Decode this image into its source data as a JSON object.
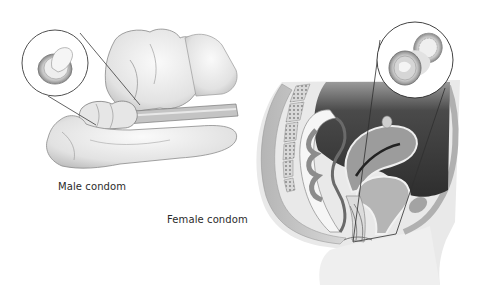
{
  "figure": {
    "panels": [
      {
        "id": "male",
        "caption": "Male condom",
        "inset": "rolled condom detail"
      },
      {
        "id": "female",
        "caption": "Female condom",
        "inset": "female condom ring detail"
      }
    ]
  },
  "colors": {
    "background": "#ffffff",
    "skin_light": "#f0f0f0",
    "skin_mid": "#d2d2d2",
    "tissue_gray": "#a9a9a9",
    "cavity_dark": "#3a3a3a",
    "outline": "#3c3c3c",
    "text": "#2b2b2b"
  }
}
